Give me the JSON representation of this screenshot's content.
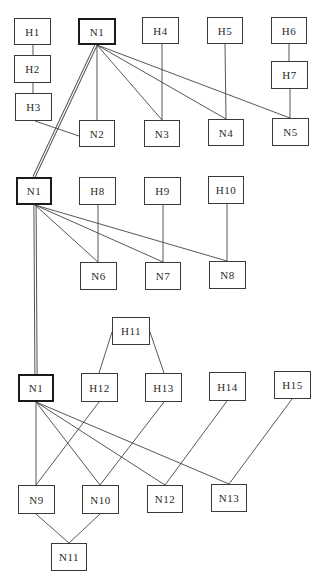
{
  "diagram": {
    "type": "graph",
    "nodes": [
      {
        "id": "H1",
        "label": "H1",
        "x": 14,
        "y": 18,
        "w": 37,
        "h": 27,
        "root": false
      },
      {
        "id": "H2",
        "label": "H2",
        "x": 14,
        "y": 55,
        "w": 37,
        "h": 28,
        "root": false
      },
      {
        "id": "H3",
        "label": "H3",
        "x": 15,
        "y": 93,
        "w": 37,
        "h": 28,
        "root": false
      },
      {
        "id": "N1a",
        "label": "N1",
        "x": 78,
        "y": 18,
        "w": 38,
        "h": 27,
        "root": true
      },
      {
        "id": "H4",
        "label": "H4",
        "x": 142,
        "y": 17,
        "w": 37,
        "h": 27,
        "root": false
      },
      {
        "id": "H5",
        "label": "H5",
        "x": 207,
        "y": 17,
        "w": 36,
        "h": 27,
        "root": false
      },
      {
        "id": "H6",
        "label": "H6",
        "x": 271,
        "y": 17,
        "w": 36,
        "h": 27,
        "root": false
      },
      {
        "id": "H7",
        "label": "H7",
        "x": 271,
        "y": 61,
        "w": 37,
        "h": 28,
        "root": false
      },
      {
        "id": "N2",
        "label": "N2",
        "x": 79,
        "y": 120,
        "w": 36,
        "h": 27,
        "root": false
      },
      {
        "id": "N3",
        "label": "N3",
        "x": 144,
        "y": 120,
        "w": 36,
        "h": 27,
        "root": false
      },
      {
        "id": "N4",
        "label": "N4",
        "x": 208,
        "y": 119,
        "w": 36,
        "h": 27,
        "root": false
      },
      {
        "id": "N5",
        "label": "N5",
        "x": 272,
        "y": 118,
        "w": 37,
        "h": 28,
        "root": false
      },
      {
        "id": "N1b",
        "label": "N1",
        "x": 16,
        "y": 177,
        "w": 36,
        "h": 28,
        "root": true
      },
      {
        "id": "H8",
        "label": "H8",
        "x": 79,
        "y": 177,
        "w": 37,
        "h": 28,
        "root": false
      },
      {
        "id": "H9",
        "label": "H9",
        "x": 144,
        "y": 177,
        "w": 37,
        "h": 28,
        "root": false
      },
      {
        "id": "H10",
        "label": "H10",
        "x": 208,
        "y": 176,
        "w": 36,
        "h": 28,
        "root": false
      },
      {
        "id": "N6",
        "label": "N6",
        "x": 80,
        "y": 262,
        "w": 37,
        "h": 28,
        "root": false
      },
      {
        "id": "N7",
        "label": "N7",
        "x": 145,
        "y": 262,
        "w": 36,
        "h": 28,
        "root": false
      },
      {
        "id": "N8",
        "label": "N8",
        "x": 209,
        "y": 261,
        "w": 37,
        "h": 28,
        "root": false
      },
      {
        "id": "H11",
        "label": "H11",
        "x": 112,
        "y": 317,
        "w": 38,
        "h": 28,
        "root": false
      },
      {
        "id": "N1c",
        "label": "N1",
        "x": 18,
        "y": 374,
        "w": 36,
        "h": 28,
        "root": true
      },
      {
        "id": "H12",
        "label": "H12",
        "x": 81,
        "y": 373,
        "w": 37,
        "h": 29,
        "root": false
      },
      {
        "id": "H13",
        "label": "H13",
        "x": 145,
        "y": 373,
        "w": 37,
        "h": 29,
        "root": false
      },
      {
        "id": "H14",
        "label": "H14",
        "x": 209,
        "y": 372,
        "w": 37,
        "h": 29,
        "root": false
      },
      {
        "id": "H15",
        "label": "H15",
        "x": 274,
        "y": 371,
        "w": 37,
        "h": 28,
        "root": false
      },
      {
        "id": "N9",
        "label": "N9",
        "x": 18,
        "y": 485,
        "w": 37,
        "h": 29,
        "root": false
      },
      {
        "id": "N10",
        "label": "N10",
        "x": 82,
        "y": 485,
        "w": 37,
        "h": 29,
        "root": false
      },
      {
        "id": "N12",
        "label": "N12",
        "x": 147,
        "y": 485,
        "w": 36,
        "h": 28,
        "root": false
      },
      {
        "id": "N13",
        "label": "N13",
        "x": 211,
        "y": 484,
        "w": 36,
        "h": 28,
        "root": false
      },
      {
        "id": "N11",
        "label": "N11",
        "x": 51,
        "y": 543,
        "w": 36,
        "h": 28,
        "root": false
      }
    ],
    "edges": [
      {
        "from": "H1",
        "to": "H2",
        "x1": 33,
        "y1": 45,
        "x2": 33,
        "y2": 55
      },
      {
        "from": "H2",
        "to": "H3",
        "x1": 33,
        "y1": 83,
        "x2": 33,
        "y2": 93
      },
      {
        "from": "H3",
        "to": "N2",
        "x1": 35,
        "y1": 121,
        "x2": 79,
        "y2": 136
      },
      {
        "from": "N1a",
        "to": "N2",
        "x1": 97,
        "y1": 45,
        "x2": 97,
        "y2": 120
      },
      {
        "from": "N1a",
        "to": "N3",
        "x1": 97,
        "y1": 45,
        "x2": 162,
        "y2": 120
      },
      {
        "from": "N1a",
        "to": "N4",
        "x1": 97,
        "y1": 45,
        "x2": 226,
        "y2": 119
      },
      {
        "from": "N1a",
        "to": "N5",
        "x1": 97,
        "y1": 45,
        "x2": 290,
        "y2": 118
      },
      {
        "from": "H4",
        "to": "N3",
        "x1": 162,
        "y1": 44,
        "x2": 162,
        "y2": 120
      },
      {
        "from": "H5",
        "to": "N4",
        "x1": 225,
        "y1": 44,
        "x2": 226,
        "y2": 119
      },
      {
        "from": "H6",
        "to": "H7",
        "x1": 289,
        "y1": 44,
        "x2": 289,
        "y2": 61
      },
      {
        "from": "H7",
        "to": "N5",
        "x1": 290,
        "y1": 89,
        "x2": 290,
        "y2": 118
      },
      {
        "from": "N1b",
        "to": "N6",
        "x1": 35,
        "y1": 205,
        "x2": 98,
        "y2": 262
      },
      {
        "from": "N1b",
        "to": "N7",
        "x1": 35,
        "y1": 205,
        "x2": 163,
        "y2": 262
      },
      {
        "from": "N1b",
        "to": "N8",
        "x1": 35,
        "y1": 205,
        "x2": 227,
        "y2": 261
      },
      {
        "from": "H8",
        "to": "N6",
        "x1": 98,
        "y1": 205,
        "x2": 98,
        "y2": 262
      },
      {
        "from": "H9",
        "to": "N7",
        "x1": 163,
        "y1": 205,
        "x2": 163,
        "y2": 262
      },
      {
        "from": "H10",
        "to": "N8",
        "x1": 227,
        "y1": 204,
        "x2": 227,
        "y2": 261
      },
      {
        "from": "H11",
        "to": "H12",
        "x1": 112,
        "y1": 332,
        "x2": 99,
        "y2": 373
      },
      {
        "from": "H11",
        "to": "H13",
        "x1": 150,
        "y1": 332,
        "x2": 164,
        "y2": 373
      },
      {
        "from": "N1c",
        "to": "N9",
        "x1": 36,
        "y1": 402,
        "x2": 36,
        "y2": 485
      },
      {
        "from": "N1c",
        "to": "N10",
        "x1": 36,
        "y1": 402,
        "x2": 100,
        "y2": 485
      },
      {
        "from": "N1c",
        "to": "N12",
        "x1": 36,
        "y1": 402,
        "x2": 165,
        "y2": 485
      },
      {
        "from": "N1c",
        "to": "N13",
        "x1": 36,
        "y1": 402,
        "x2": 229,
        "y2": 484
      },
      {
        "from": "H12",
        "to": "N9",
        "x1": 99,
        "y1": 402,
        "x2": 36,
        "y2": 485
      },
      {
        "from": "H13",
        "to": "N10",
        "x1": 164,
        "y1": 402,
        "x2": 100,
        "y2": 485
      },
      {
        "from": "H14",
        "to": "N12",
        "x1": 227,
        "y1": 401,
        "x2": 165,
        "y2": 485
      },
      {
        "from": "H15",
        "to": "N13",
        "x1": 292,
        "y1": 399,
        "x2": 229,
        "y2": 484
      },
      {
        "from": "N9",
        "to": "N11",
        "x1": 36,
        "y1": 514,
        "x2": 69,
        "y2": 543
      },
      {
        "from": "N10",
        "to": "N11",
        "x1": 100,
        "y1": 514,
        "x2": 69,
        "y2": 543
      }
    ],
    "double_edges": [
      {
        "from": "N1a",
        "to": "N1b",
        "x1": 96,
        "y1": 45,
        "x2": 34,
        "y2": 177
      },
      {
        "from": "N1b",
        "to": "N1c",
        "x1": 35,
        "y1": 205,
        "x2": 36,
        "y2": 374
      }
    ]
  }
}
